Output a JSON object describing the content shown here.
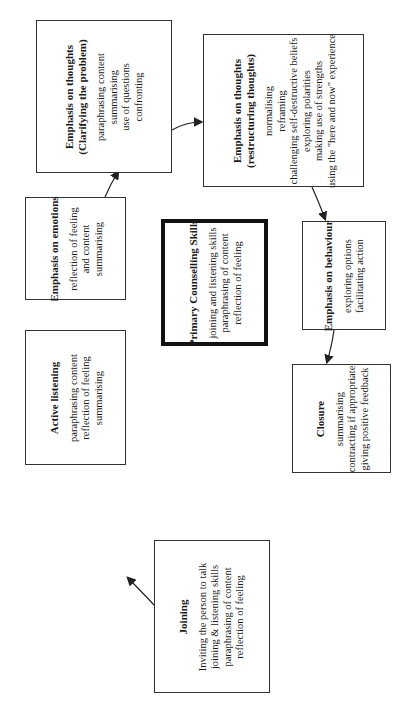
{
  "diagram": {
    "boxes": [
      {
        "id": "clarifying",
        "title_lines": [
          "Emphasis on thoughts",
          "(Clarifying the problem)"
        ],
        "items": [
          "paraphrasing content",
          "summarising",
          "use of questions",
          "confronting"
        ]
      },
      {
        "id": "restructuring",
        "title_lines": [
          "Emphasis on thoughts",
          "(restructuring thoughts)"
        ],
        "items": [
          "normalising",
          "reframing",
          "challenging self-destructive beliefs",
          "exploring polarities",
          "making use of strengths",
          "using the \"here and now\" experience"
        ]
      },
      {
        "id": "emotions",
        "title_lines": [
          "Emphasis on emotions"
        ],
        "items": [
          "reflection of feeling",
          "and content",
          "summarising"
        ]
      },
      {
        "id": "primary",
        "title_lines": [
          "Primary Counselling Skills"
        ],
        "items": [
          "joining and listening skills",
          "paraphrasing of content",
          "reflection of feeling"
        ]
      },
      {
        "id": "behaviour",
        "title_lines": [
          "Emphasis on behaviour"
        ],
        "items": [
          "exploring options",
          "facilitating action"
        ]
      },
      {
        "id": "active-listening",
        "title_lines": [
          "Active listening"
        ],
        "items": [
          "paraphrasing content",
          "reflection of feeling",
          "summarising"
        ]
      },
      {
        "id": "joining",
        "title_lines": [
          "Joining"
        ],
        "items": [
          "Inviting the person to talk",
          "joining & listening skills",
          "paraphrasing of content",
          "reflection of feeling"
        ]
      },
      {
        "id": "closure",
        "title_lines": [
          "Closure"
        ],
        "items": [
          "summarising",
          "contracting if appropriate",
          "giving positive feedback"
        ]
      }
    ],
    "flow": [
      "joining",
      "active-listening",
      "emotions",
      "clarifying",
      "restructuring",
      "behaviour",
      "closure"
    ]
  }
}
